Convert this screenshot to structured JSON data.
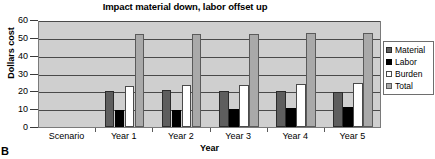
{
  "figure": {
    "panel_letter": "B"
  },
  "chart_data": {
    "type": "bar",
    "title": "Impact material down, labor offset up",
    "xlabel": "Year",
    "ylabel": "Dollars cost",
    "ylim": [
      0,
      60
    ],
    "yticks": [
      0,
      10,
      20,
      30,
      40,
      50,
      60
    ],
    "grid": true,
    "legend_position": "right",
    "categories": [
      "Scenario",
      "Year 1",
      "Year 2",
      "Year 3",
      "Year 4",
      "Year 5"
    ],
    "series": [
      {
        "name": "Material",
        "color": "#5e5e5e",
        "values": [
          null,
          20,
          20.5,
          20,
          20,
          19.5
        ]
      },
      {
        "name": "Labor",
        "color": "#000000",
        "values": [
          null,
          9.5,
          9.5,
          10,
          10.5,
          11
        ]
      },
      {
        "name": "Burden",
        "color": "#ffffff",
        "values": [
          null,
          23,
          23.5,
          23.5,
          24,
          24.5
        ]
      },
      {
        "name": "Total",
        "color": "#a9a9a9",
        "values": [
          null,
          52,
          52,
          52,
          52.5,
          52.5
        ]
      }
    ]
  }
}
